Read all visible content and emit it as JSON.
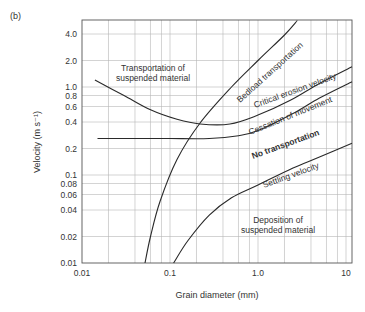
{
  "panel_label": "(b)",
  "chart_data": {
    "type": "line",
    "title": "",
    "xlabel": "Grain diameter (mm)",
    "ylabel": "Velocity (m s⁻¹)",
    "xscale": "log",
    "yscale": "log",
    "xlim": [
      0.01,
      11.7
    ],
    "ylim": [
      0.01,
      5.7
    ],
    "grid": true,
    "x_ticks": [
      "0.01",
      "0.1",
      "1.0",
      "10"
    ],
    "y_ticks": [
      "4.0",
      "2.0",
      "1.0",
      "0.8",
      "0.6",
      "0.4",
      "0.2",
      "0.1",
      "0.08",
      "0.06",
      "0.04",
      "0.02",
      "0.01"
    ],
    "series": [
      {
        "name": "Critical erosion velocity",
        "x": [
          0.014,
          0.03,
          0.06,
          0.12,
          0.22,
          0.48,
          1.0,
          2.3,
          5.0,
          11.7
        ],
        "y": [
          1.2,
          0.8,
          0.55,
          0.43,
          0.38,
          0.38,
          0.48,
          0.7,
          1.1,
          1.7
        ]
      },
      {
        "name": "Cessation of movement",
        "x": [
          0.015,
          0.05,
          0.1,
          0.28,
          0.6,
          1.0,
          2.5,
          5.0,
          11.7
        ],
        "y": [
          0.26,
          0.26,
          0.26,
          0.26,
          0.28,
          0.32,
          0.5,
          0.75,
          1.15
        ]
      },
      {
        "name": "Bedload transportation",
        "x": [
          0.052,
          0.06,
          0.077,
          0.12,
          0.22,
          0.5,
          1.0,
          2.0,
          2.8
        ],
        "y": [
          0.01,
          0.02,
          0.05,
          0.15,
          0.39,
          1.0,
          2.0,
          3.9,
          5.7
        ]
      },
      {
        "name": "Settling velocity",
        "x": [
          0.11,
          0.16,
          0.28,
          0.5,
          1.0,
          2.5,
          5.0,
          11.7
        ],
        "y": [
          0.01,
          0.018,
          0.035,
          0.055,
          0.077,
          0.12,
          0.16,
          0.23
        ]
      }
    ],
    "annotations": [
      {
        "text": "Transportation of suspended material",
        "x": 0.06,
        "y": 1.8
      },
      {
        "text": "Bedload transportation",
        "x": 1.5,
        "y": 1.6,
        "rotated": true
      },
      {
        "text": "Critical erosion velocity",
        "x": 2.2,
        "y": 0.75,
        "rotated": true
      },
      {
        "text": "Cessation of movement",
        "x": 2.2,
        "y": 0.4,
        "rotated": true
      },
      {
        "text": "No transportation",
        "x": 1.0,
        "y": 0.17,
        "bold": true,
        "rotated": true
      },
      {
        "text": "Settling velocity",
        "x": 2.0,
        "y": 0.065,
        "rotated": true
      },
      {
        "text": "Deposition of suspended material",
        "x": 1.7,
        "y": 0.025
      }
    ]
  },
  "labels": {
    "region_top_line1": "Transportation of",
    "region_top_line2": "suspended material",
    "region_bottom_line1": "Deposition of",
    "region_bottom_line2": "suspended material",
    "bedload": "Bedload transportation",
    "critical": "Critical erosion velocity",
    "cessation": "Cessation of movement",
    "no_transport": "No transportation",
    "settling": "Settling velocity"
  }
}
